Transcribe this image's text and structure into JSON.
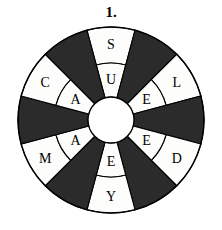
{
  "puzzle": {
    "number_label": "1.",
    "type": "word-wheel",
    "sector_count": 12,
    "sector_angle_deg": 30,
    "ring_count": 2,
    "colors": {
      "dark_wedge": "#2b2b2b",
      "light_wedge": "#fdfdfb",
      "outline": "#000000",
      "hub": "#ffffff",
      "background": "#ffffff"
    },
    "geometry": {
      "center_x": 111,
      "center_y": 120,
      "outer_radius": 93,
      "ring_divider_radius": 57,
      "hub_radius": 23
    },
    "sectors": [
      {
        "index": 0,
        "start_deg": -15,
        "fill": "light",
        "outer_letter": "S",
        "inner_letter": "U"
      },
      {
        "index": 1,
        "start_deg": 15,
        "fill": "dark",
        "outer_letter": "",
        "inner_letter": ""
      },
      {
        "index": 2,
        "start_deg": 45,
        "fill": "light",
        "outer_letter": "L",
        "inner_letter": "E"
      },
      {
        "index": 3,
        "start_deg": 75,
        "fill": "dark",
        "outer_letter": "",
        "inner_letter": ""
      },
      {
        "index": 4,
        "start_deg": 105,
        "fill": "light",
        "outer_letter": "D",
        "inner_letter": "E"
      },
      {
        "index": 5,
        "start_deg": 135,
        "fill": "dark",
        "outer_letter": "",
        "inner_letter": ""
      },
      {
        "index": 6,
        "start_deg": 165,
        "fill": "light",
        "outer_letter": "Y",
        "inner_letter": "E"
      },
      {
        "index": 7,
        "start_deg": 195,
        "fill": "dark",
        "outer_letter": "",
        "inner_letter": ""
      },
      {
        "index": 8,
        "start_deg": 225,
        "fill": "light",
        "outer_letter": "M",
        "inner_letter": "A"
      },
      {
        "index": 9,
        "start_deg": 255,
        "fill": "dark",
        "outer_letter": "",
        "inner_letter": ""
      },
      {
        "index": 10,
        "start_deg": 285,
        "fill": "light",
        "outer_letter": "C",
        "inner_letter": "A"
      },
      {
        "index": 11,
        "start_deg": 315,
        "fill": "dark",
        "outer_letter": "",
        "inner_letter": ""
      }
    ],
    "letters_outer_clockwise_from_top": [
      "S",
      "L",
      "D",
      "Y",
      "M",
      "C"
    ],
    "letters_inner_clockwise_from_top": [
      "U",
      "E",
      "E",
      "E",
      "A",
      "A"
    ]
  }
}
